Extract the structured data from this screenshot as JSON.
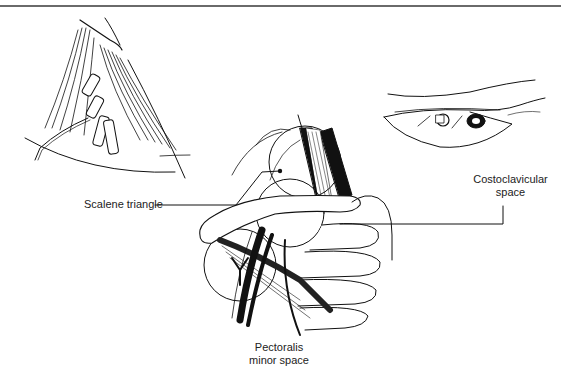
{
  "figure": {
    "panels": [
      {
        "name": "neck-muscles-inset",
        "description": "Scalene muscles with brachial plexus roots"
      },
      {
        "name": "costoclavicular-inset",
        "description": "Costoclavicular space view beneath clavicle"
      },
      {
        "name": "main-shoulder-view",
        "description": "Neurovascular bundle passing over first rib, under clavicle and pectoralis minor"
      }
    ],
    "labels": {
      "scalene_triangle": "Scalene triangle",
      "costoclavicular_line1": "Costoclavicular",
      "costoclavicular_line2": "space",
      "pectoralis_line1": "Pectoralis",
      "pectoralis_line2": "minor space"
    },
    "colors": {
      "ink": "#111111",
      "background": "#ffffff",
      "rule": "#6a6a6a"
    }
  }
}
